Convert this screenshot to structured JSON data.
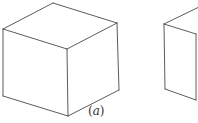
{
  "figure": {
    "panels": [
      {
        "id": "a",
        "label_open": "(",
        "label_letter": "a",
        "label_close": ")",
        "shape": "cube",
        "view": "isometric, viewed from above"
      },
      {
        "id": "b",
        "shape": "cube",
        "view": "partially visible, cropped at right edge"
      }
    ],
    "colors": {
      "line": "#4a4a4a",
      "background": "#ffffff"
    }
  }
}
